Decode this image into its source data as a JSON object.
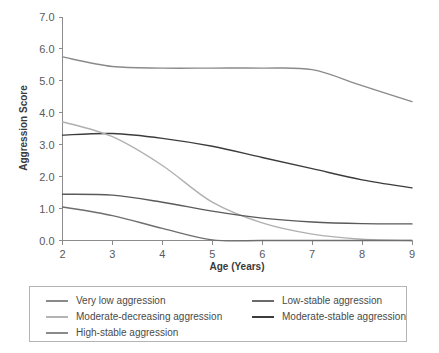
{
  "chart_data": {
    "type": "line",
    "title": "",
    "xlabel": "Age (Years)",
    "ylabel": "Aggression Score",
    "xlim": [
      2,
      9
    ],
    "ylim": [
      0.0,
      7.0
    ],
    "xticks": [
      "2",
      "3",
      "4",
      "5",
      "6",
      "7",
      "8",
      "9"
    ],
    "yticks": [
      "0.0",
      "1.0",
      "2.0",
      "3.0",
      "4.0",
      "5.0",
      "6.0",
      "7.0"
    ],
    "grid": false,
    "legend_position": "below",
    "x": [
      2,
      3,
      4,
      5,
      6,
      7,
      8,
      9
    ],
    "series": [
      {
        "name": "High-stable aggression",
        "color": "#8a8a8a",
        "values": [
          5.75,
          5.45,
          5.4,
          5.4,
          5.4,
          5.35,
          4.85,
          4.35
        ]
      },
      {
        "name": "Moderate-stable aggression",
        "color": "#3c3c3c",
        "values": [
          3.3,
          3.35,
          3.2,
          2.95,
          2.6,
          2.25,
          1.9,
          1.65
        ]
      },
      {
        "name": "Moderate-decreasing aggression",
        "color": "#b0b0b0",
        "values": [
          3.72,
          3.25,
          2.35,
          1.2,
          0.55,
          0.2,
          0.04,
          0.0
        ]
      },
      {
        "name": "Low-stable aggression",
        "color": "#5a5a5a",
        "values": [
          1.45,
          1.42,
          1.2,
          0.92,
          0.7,
          0.58,
          0.53,
          0.52
        ]
      },
      {
        "name": "Very low aggression",
        "color": "#6e6e6e",
        "values": [
          1.05,
          0.78,
          0.38,
          0.02,
          0.0,
          0.0,
          0.0,
          0.0
        ]
      }
    ]
  },
  "legend": {
    "left_column": [
      {
        "label": "Very low aggression",
        "color": "#8a8a8a"
      },
      {
        "label": "Moderate-decreasing aggression",
        "color": "#b4b4b4"
      },
      {
        "label": "High-stable aggression",
        "color": "#8a8a8a"
      }
    ],
    "right_column": [
      {
        "label": "Low-stable aggression",
        "color": "#6a6a6a"
      },
      {
        "label": "Moderate-stable aggression",
        "color": "#3c3c3c"
      }
    ]
  }
}
